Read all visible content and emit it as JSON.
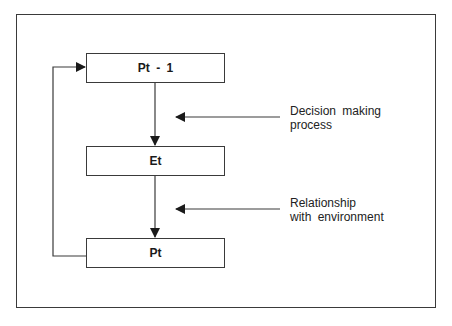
{
  "diagram": {
    "nodes": [
      {
        "id": "p_prev",
        "label": "Pt - 1"
      },
      {
        "id": "e_t",
        "label": "Et"
      },
      {
        "id": "p_t",
        "label": "Pt"
      }
    ],
    "annotations": [
      {
        "target": "edge p_prev->e_t",
        "line1": "Decision making",
        "line2": "process"
      },
      {
        "target": "edge e_t->p_t",
        "line1": "Relationship",
        "line2": "with environment"
      }
    ],
    "edges": [
      {
        "from": "p_prev",
        "to": "e_t"
      },
      {
        "from": "e_t",
        "to": "p_t"
      },
      {
        "from": "p_t",
        "to": "p_prev",
        "type": "feedback"
      }
    ],
    "colors": {
      "line": "#3a3a3a",
      "background": "#ffffff"
    }
  }
}
